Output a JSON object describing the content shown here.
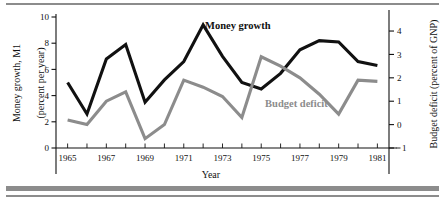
{
  "chart_data": {
    "type": "line",
    "title": "",
    "xlabel": "Year",
    "ylabel": "Money growth, M1 (percent per year)",
    "y2label": "Budget deficit (percent of GNP)",
    "x": [
      1965,
      1966,
      1967,
      1968,
      1969,
      1970,
      1971,
      1972,
      1973,
      1974,
      1975,
      1976,
      1977,
      1978,
      1979,
      1980,
      1981
    ],
    "xlim": [
      1964.4,
      1981.6
    ],
    "xticks": [
      1965,
      1966,
      1967,
      1968,
      1969,
      1970,
      1971,
      1972,
      1973,
      1974,
      1975,
      1976,
      1977,
      1978,
      1979,
      1980,
      1981
    ],
    "xticklabels": [
      "1965",
      "",
      "1967",
      "",
      "1969",
      "",
      "1971",
      "",
      "1973",
      "",
      "1975",
      "",
      "1977",
      "",
      "1979",
      "",
      "1981"
    ],
    "ylim": [
      0,
      10
    ],
    "yticks": [
      0,
      2,
      4,
      6,
      8,
      10
    ],
    "yticklabels": [
      "0",
      "2",
      "4",
      "6",
      "8",
      "10"
    ],
    "y2lim": [
      -1,
      4.6
    ],
    "y2ticks": [
      -1,
      0,
      1,
      2,
      3,
      4
    ],
    "y2ticklabels": [
      "1",
      "0",
      "1",
      "2",
      "3",
      "4"
    ],
    "grid": false,
    "legend_position": "inline-annotations",
    "series": [
      {
        "name": "Money growth",
        "axis": "left",
        "color": "#111111",
        "label_x": 1972.1,
        "label_y": 9.05,
        "values": [
          5.0,
          2.6,
          6.8,
          7.9,
          3.5,
          5.2,
          6.6,
          9.4,
          7.0,
          5.0,
          4.5,
          5.7,
          7.5,
          8.2,
          8.1,
          6.6,
          6.3
        ]
      },
      {
        "name": "Budget deficit",
        "axis": "right",
        "color": "#8c8c8c",
        "label_x": 1975.2,
        "label_y": 0.75,
        "values": [
          0.2,
          0.0,
          1.0,
          1.4,
          -0.6,
          0.0,
          1.9,
          1.6,
          1.2,
          0.3,
          2.9,
          2.5,
          2.0,
          1.3,
          0.45,
          1.9,
          1.85
        ]
      }
    ],
    "annotations": [
      {
        "text": "Money growth",
        "color": "#111111"
      },
      {
        "text": "Budget deficit",
        "color": "#8c8c8c"
      }
    ]
  },
  "axes": {
    "left_title_line1": "Money growth, M1",
    "left_title_line2": "(percent per year)",
    "right_title": "Budget deficit (percent of GNP)",
    "x_title": "Year"
  },
  "colors": {
    "money_growth": "#111111",
    "budget_deficit": "#8c8c8c",
    "rule": "#8c8c8c",
    "background": "#ffffff"
  }
}
